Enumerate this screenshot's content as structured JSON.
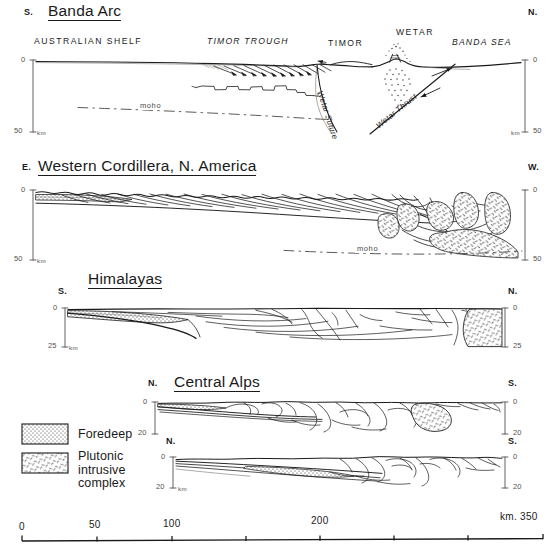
{
  "figure": {
    "kind": "geological-cross-sections",
    "colors": {
      "ink": "#1a1a1a",
      "axis": "#55504e",
      "paper": "#ffffff"
    }
  },
  "panels": [
    {
      "id": "banda-arc",
      "title": "Banda Arc",
      "left_dir": "S.",
      "right_dir": "N.",
      "depth_top": "0",
      "depth_bottom": "50",
      "depth_unit": "km",
      "regions": [
        {
          "label": "AUSTRALIAN SHELF",
          "style": "roman"
        },
        {
          "label": "TIMOR TROUGH",
          "style": "italic"
        },
        {
          "label": "TIMOR",
          "style": "roman"
        },
        {
          "label": "WETAR",
          "style": "roman"
        },
        {
          "label": "BANDA SEA",
          "style": "italic"
        }
      ],
      "annotations": [
        {
          "label": "moho",
          "kind": "moho-line"
        },
        {
          "label": "Wetar Suture",
          "kind": "fault"
        },
        {
          "label": "Wetar Thrust",
          "kind": "fault"
        }
      ]
    },
    {
      "id": "western-cordillera",
      "title": "Western Cordillera, N. America",
      "left_dir": "E.",
      "right_dir": "W.",
      "depth_top": "0",
      "depth_bottom": "50",
      "depth_unit": "km",
      "regions": [],
      "annotations": [
        {
          "label": "moho",
          "kind": "moho-line"
        }
      ]
    },
    {
      "id": "himalayas",
      "title": "Himalayas",
      "left_dir": "S.",
      "right_dir": "N.",
      "depth_top": "0",
      "depth_bottom": "25",
      "depth_unit": "km",
      "regions": [],
      "annotations": []
    },
    {
      "id": "central-alps-upper",
      "title": "Central Alps",
      "left_dir": "N.",
      "right_dir": "S.",
      "depth_top": "0",
      "depth_bottom": "20",
      "depth_unit": "km",
      "regions": [],
      "annotations": []
    },
    {
      "id": "central-alps-lower",
      "title": "",
      "left_dir": "N.",
      "right_dir": "S.",
      "depth_top": "0",
      "depth_bottom": "20",
      "depth_unit": "km",
      "regions": [],
      "annotations": []
    }
  ],
  "legend": {
    "items": [
      {
        "key": "foredeep",
        "label": "Foredeep",
        "pattern": "stipple"
      },
      {
        "key": "pluton",
        "label": "Plutonic intrusive complex",
        "pattern": "dashes"
      }
    ]
  },
  "scalebar": {
    "unit_label": "km.",
    "ticks": [
      "0",
      "50",
      "100",
      "150",
      "200",
      "250",
      "300",
      "350"
    ],
    "labelled": [
      "0",
      "50",
      "100",
      "200",
      "350"
    ],
    "end_label": "km. 350"
  }
}
